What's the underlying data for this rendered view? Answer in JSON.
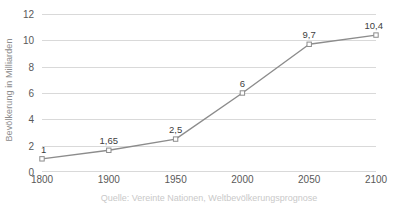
{
  "chart_data": {
    "type": "line",
    "title": "",
    "xlabel": "",
    "ylabel": "Bevölkerung in Milliarden",
    "categories": [
      "1800",
      "1900",
      "1950",
      "2000",
      "2050",
      "2100"
    ],
    "values": [
      1,
      1.65,
      2.5,
      6,
      9.7,
      10.4
    ],
    "point_labels": [
      "1",
      "1,65",
      "2,5",
      "6",
      "9,7",
      "10,4"
    ],
    "ylim": [
      0,
      12
    ],
    "yticks": [
      0,
      2,
      4,
      6,
      8,
      10,
      12
    ],
    "ytick_labels": [
      "0",
      "2",
      "4",
      "6",
      "8",
      "10",
      "12"
    ],
    "grid": true,
    "legend": false,
    "series": [
      {
        "name": "Bevölkerung in Milliarden",
        "values": [
          1,
          1.65,
          2.5,
          6,
          9.7,
          10.4
        ]
      }
    ],
    "colors": {
      "line": "#8c8c8c",
      "marker_stroke": "#8c8c8c",
      "marker_fill": "#ffffff",
      "gridline": "#d9d9d9",
      "tick_text": "#595959",
      "axis_title": "#8c8c8c",
      "data_label": "#404040",
      "background": "#ffffff"
    }
  },
  "caption": {
    "clipped_text": "Quelle: Vereinte Nationen, Weltbevölkerungsprognose"
  }
}
